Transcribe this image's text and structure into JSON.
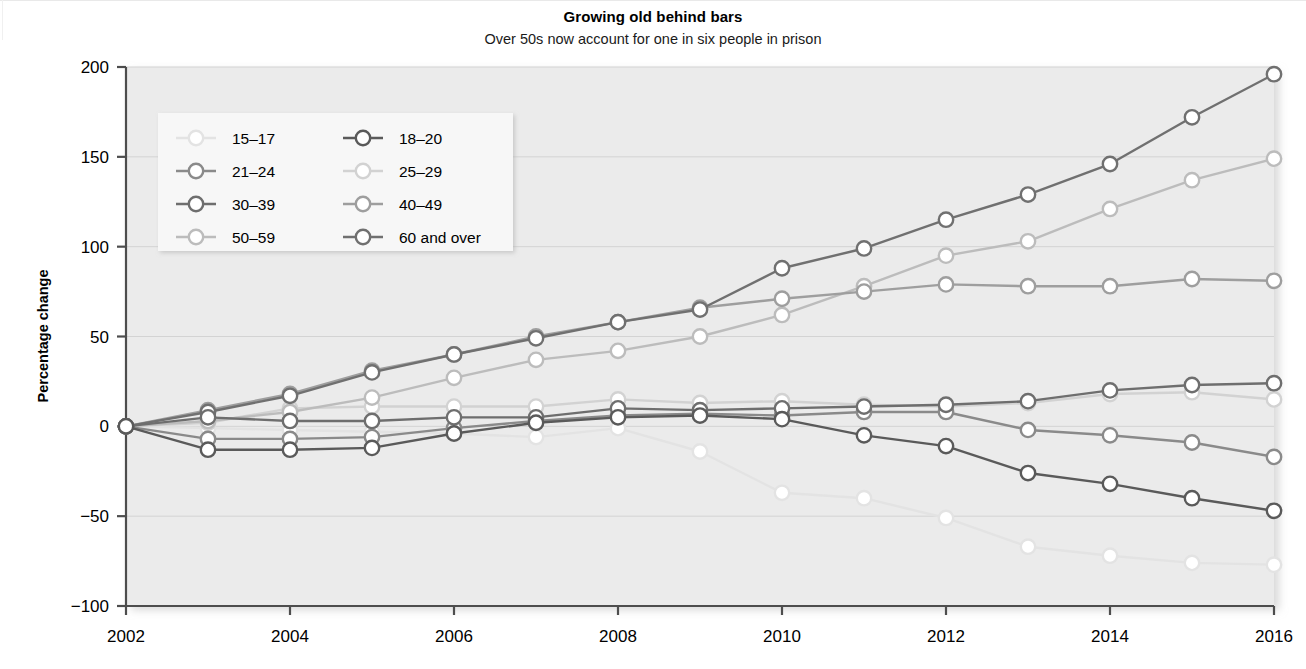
{
  "header": {
    "title": "Growing old behind bars",
    "subtitle": "Over 50s now account for one in six people in prison"
  },
  "axes": {
    "y_title": "Percentage change",
    "y_ticks": [
      "200",
      "150",
      "100",
      "50",
      "0",
      "-50",
      "-100"
    ],
    "x_ticks": [
      "2002",
      "2004",
      "2006",
      "2008",
      "2010",
      "2012",
      "2014",
      "2016"
    ]
  },
  "legend": {
    "entries": [
      {
        "label": "15–17",
        "color": "#e3e3e3"
      },
      {
        "label": "18–20",
        "color": "#5a5a5a"
      },
      {
        "label": "21–24",
        "color": "#8a8a8a"
      },
      {
        "label": "25–29",
        "color": "#d2d2d2"
      },
      {
        "label": "30–39",
        "color": "#6e6e6e"
      },
      {
        "label": "40–49",
        "color": "#9e9e9e"
      },
      {
        "label": "50–59",
        "color": "#bcbcbc"
      },
      {
        "label": "60 and over",
        "color": "#707070"
      }
    ]
  },
  "chart_data": {
    "type": "line",
    "title": "Growing old behind bars",
    "subtitle": "Over 50s now account for one in six people in prison",
    "xlabel": "",
    "ylabel": "Percentage change",
    "ylim": [
      -100,
      200
    ],
    "xlim": [
      2002,
      2016
    ],
    "grid": true,
    "legend_position": "top-left inside plot",
    "x": [
      2002,
      2003,
      2004,
      2005,
      2006,
      2007,
      2008,
      2009,
      2010,
      2011,
      2012,
      2013,
      2014,
      2015,
      2016
    ],
    "series": [
      {
        "name": "15–17",
        "color": "#e3e3e3",
        "values": [
          0,
          -1,
          -2,
          -3,
          -4,
          -6,
          -1,
          -14,
          -37,
          -40,
          -51,
          -67,
          -72,
          -76,
          -77
        ]
      },
      {
        "name": "18–20",
        "color": "#5a5a5a",
        "values": [
          0,
          -13,
          -13,
          -12,
          -4,
          2,
          5,
          6,
          4,
          -5,
          -11,
          -26,
          -32,
          -40,
          -47
        ]
      },
      {
        "name": "21–24",
        "color": "#8a8a8a",
        "values": [
          0,
          -7,
          -7,
          -6,
          -1,
          3,
          6,
          7,
          6,
          8,
          8,
          -2,
          -5,
          -9,
          -17
        ]
      },
      {
        "name": "25–29",
        "color": "#d2d2d2",
        "values": [
          0,
          2,
          10,
          11,
          11,
          11,
          15,
          13,
          14,
          12,
          11,
          13,
          18,
          19,
          15
        ]
      },
      {
        "name": "30–39",
        "color": "#6e6e6e",
        "values": [
          0,
          5,
          3,
          3,
          5,
          5,
          10,
          9,
          10,
          11,
          12,
          14,
          20,
          23,
          24
        ]
      },
      {
        "name": "40–49",
        "color": "#9e9e9e",
        "values": [
          0,
          9,
          18,
          31,
          40,
          50,
          58,
          66,
          71,
          75,
          79,
          78,
          78,
          82,
          81
        ]
      },
      {
        "name": "50–59",
        "color": "#bcbcbc",
        "values": [
          0,
          3,
          8,
          16,
          27,
          37,
          42,
          50,
          62,
          78,
          95,
          103,
          121,
          137,
          149
        ]
      },
      {
        "name": "60 and over",
        "color": "#707070",
        "values": [
          0,
          8,
          17,
          30,
          40,
          49,
          58,
          65,
          88,
          99,
          115,
          129,
          146,
          172,
          196
        ]
      }
    ]
  }
}
